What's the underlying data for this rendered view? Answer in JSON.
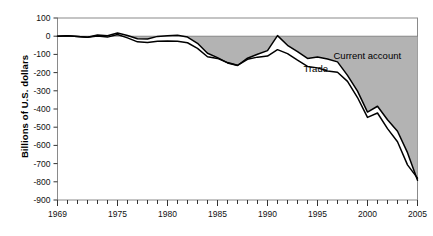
{
  "chart_data": {
    "type": "area",
    "title": "",
    "subtitle": "",
    "xlabel": "",
    "ylabel": "Billions of U.S. dollars",
    "xlim": [
      1969,
      2005
    ],
    "ylim": [
      -900,
      100
    ],
    "xticks": [
      1969,
      1970,
      1971,
      1972,
      1973,
      1974,
      1975,
      1976,
      1977,
      1978,
      1979,
      1980,
      1981,
      1982,
      1983,
      1984,
      1985,
      1986,
      1987,
      1988,
      1989,
      1990,
      1991,
      1992,
      1993,
      1994,
      1995,
      1996,
      1997,
      1998,
      1999,
      2000,
      2001,
      2002,
      2003,
      2004,
      2005
    ],
    "xtick_labels": [
      "1969",
      "1975",
      "1980",
      "1985",
      "1990",
      "1995",
      "2000",
      "2005"
    ],
    "xtick_label_values": [
      1969,
      1975,
      1980,
      1985,
      1990,
      1995,
      2000,
      2005
    ],
    "yticks": [
      100,
      0,
      -100,
      -200,
      -300,
      -400,
      -500,
      -600,
      -700,
      -800,
      -900
    ],
    "ytick_labels": [
      "100",
      "0",
      "-100",
      "-200",
      "-300",
      "-400",
      "-500",
      "-600",
      "-700",
      "-800",
      "-900"
    ],
    "grid": false,
    "legend_position": "inline-annotation",
    "fill_color": "#b3b3b3",
    "line_color": "#000000",
    "x": [
      1969,
      1970,
      1971,
      1972,
      1973,
      1974,
      1975,
      1976,
      1977,
      1978,
      1979,
      1980,
      1981,
      1982,
      1983,
      1984,
      1985,
      1986,
      1987,
      1988,
      1989,
      1990,
      1991,
      1992,
      1993,
      1994,
      1995,
      1996,
      1997,
      1998,
      1999,
      2000,
      2001,
      2002,
      2003,
      2004,
      2005
    ],
    "series": [
      {
        "name": "Current account",
        "label": "Current account",
        "values": [
          0,
          2,
          -1,
          -6,
          7,
          2,
          18,
          4,
          -14,
          -15,
          -1,
          2,
          5,
          -5,
          -39,
          -94,
          -118,
          -147,
          -161,
          -121,
          -99,
          -79,
          3,
          -50,
          -85,
          -122,
          -114,
          -125,
          -141,
          -215,
          -302,
          -417,
          -385,
          -459,
          -522,
          -640,
          -792
        ]
      },
      {
        "name": "Trade",
        "label": "Trade",
        "values": [
          0,
          2,
          -2,
          -6,
          1,
          -5,
          9,
          -9,
          -31,
          -34,
          -28,
          -26,
          -28,
          -36,
          -67,
          -113,
          -122,
          -145,
          -160,
          -127,
          -115,
          -109,
          -74,
          -96,
          -132,
          -166,
          -174,
          -191,
          -198,
          -248,
          -337,
          -446,
          -422,
          -508,
          -580,
          -707,
          -780
        ]
      }
    ],
    "annotations": [
      {
        "text": "Current account",
        "x": 1996.6,
        "y": -126
      },
      {
        "text": "Trade",
        "x": 1993.6,
        "y": -196
      }
    ]
  }
}
